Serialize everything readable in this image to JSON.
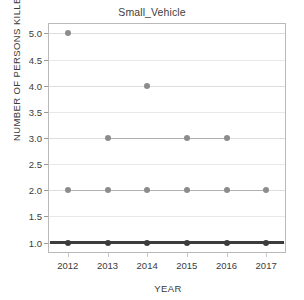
{
  "chart_data": {
    "type": "scatter",
    "title": "Small_Vehicle",
    "xlabel": "YEAR",
    "ylabel": "NUMBER OF PERSONS KILLED",
    "categories": [
      "2012",
      "2013",
      "2014",
      "2015",
      "2016",
      "2017"
    ],
    "x_tick_labels": [
      "2012",
      "2013",
      "2014",
      "2015",
      "2016",
      "2017"
    ],
    "y_tick_labels": [
      "1.0",
      "1.5",
      "2.0",
      "2.5",
      "3.0",
      "3.5",
      "4.0",
      "4.5",
      "5.0"
    ],
    "y_tick_values": [
      1.0,
      1.5,
      2.0,
      2.5,
      3.0,
      3.5,
      4.0,
      4.5,
      5.0
    ],
    "ylim": [
      0.8,
      5.2
    ],
    "grid": true,
    "legend": false,
    "marker_color": "#8c8c8c",
    "line_color": "#b0b0b0",
    "baseline_color": "#3c3c3c",
    "points": [
      {
        "year": "2012",
        "values": [
          1,
          2,
          5
        ]
      },
      {
        "year": "2013",
        "values": [
          1,
          2,
          3
        ]
      },
      {
        "year": "2014",
        "values": [
          1,
          2,
          4
        ]
      },
      {
        "year": "2015",
        "values": [
          1,
          2,
          3
        ]
      },
      {
        "year": "2016",
        "values": [
          1,
          2,
          3
        ]
      },
      {
        "year": "2017",
        "values": [
          1,
          2
        ]
      }
    ],
    "levels": [
      {
        "value": 5,
        "years": [
          "2012"
        ]
      },
      {
        "value": 4,
        "years": [
          "2014"
        ]
      },
      {
        "value": 3,
        "years": [
          "2013",
          "2015",
          "2016"
        ]
      },
      {
        "value": 2,
        "years": [
          "2012",
          "2013",
          "2014",
          "2015",
          "2016",
          "2017"
        ]
      },
      {
        "value": 1,
        "years": [
          "2012",
          "2013",
          "2014",
          "2015",
          "2016",
          "2017"
        ]
      }
    ]
  }
}
